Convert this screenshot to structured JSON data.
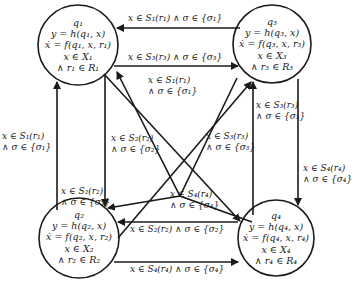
{
  "diagram": {
    "type": "hybrid-automaton",
    "nodes": [
      {
        "id": "q1",
        "lines": [
          "q₁",
          "y = h(q₁, x)",
          "ẋ = f(q₁, x, r₁)",
          "x ∈ X₁",
          "∧ r₁ ∈ R₁"
        ]
      },
      {
        "id": "q2",
        "lines": [
          "q₂",
          "y = h(q₂, x)",
          "ẋ = f(q₂, x, r₂)",
          "x ∈ X₂",
          "∧ r₂ ∈ R₂"
        ]
      },
      {
        "id": "q3",
        "lines": [
          "q₃",
          "y = h(q₃, x)",
          "ẋ = f(q₃, x, r₃)",
          "x ∈ X₃",
          "∧ r₃ ∈ R₃"
        ]
      },
      {
        "id": "q4",
        "lines": [
          "q₄",
          "y = h(q₄, x)",
          "ẋ = f(q₄, x, r₄)",
          "x ∈ X₄",
          "∧ r₄ ∈ R₄"
        ]
      }
    ],
    "edges": [
      {
        "from": "q3",
        "to": "q1",
        "label": "x ∈ S₁(r₁) ∧ σ ∈ {σ₁}"
      },
      {
        "from": "q1",
        "to": "q3",
        "label": "x ∈ S₃(r₃) ∧ σ ∈ {σ₃}"
      },
      {
        "from": "q4",
        "to": "q1",
        "label_l1": "x ∈ S₁(r₁)",
        "label_l2": "∧ σ ∈ {σ₁}"
      },
      {
        "from": "q2",
        "to": "q1",
        "label_l1": "x ∈ S₁(r₁)",
        "label_l2": "∧ σ ∈ {σ₁}"
      },
      {
        "from": "q1",
        "to": "q2",
        "label_l1": "x ∈ S₂(r₂)",
        "label_l2": "∧ σ ∈ {σ₂}"
      },
      {
        "from": "q3",
        "to": "q2",
        "label_l1": "x ∈ S₂(r₂)",
        "label_l2": "∧ σ ∈ {σ₂}"
      },
      {
        "from": "q2",
        "to": "q3",
        "label_l1": "x ∈ S₃(r₃)",
        "label_l2": "∧ σ ∈ {σ₃}"
      },
      {
        "from": "q4",
        "to": "q3",
        "label_l1": "x ∈ S₃(r₃)",
        "label_l2": "∧ σ ∈ {σ₃}"
      },
      {
        "from": "q3",
        "to": "q4",
        "label_l1": "x ∈ S₄(r₄)",
        "label_l2": "∧ σ ∈ {σ₄}"
      },
      {
        "from": "q1",
        "to": "q4",
        "label_l1": "x ∈ S₄(r₄)",
        "label_l2": "∧ σ ∈ {σ₄}"
      },
      {
        "from": "q4",
        "to": "q2",
        "label": "x ∈ S₂(r₂) ∧ σ ∈ {σ₂}"
      },
      {
        "from": "q2",
        "to": "q4",
        "label": "x ∈ S₄(r₄) ∧ σ ∈ {σ₄}"
      }
    ]
  },
  "colors": {
    "stroke": "#1a1a1a",
    "background": "#ffffff"
  }
}
